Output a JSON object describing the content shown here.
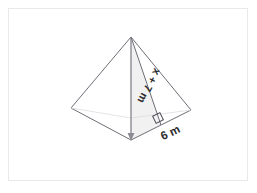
{
  "figure": {
    "name": "square-pyramid-with-slant-height",
    "background_color": "#ffffff",
    "frame_border_color": "#e9e9e9",
    "stroke_color": "#6e6e78",
    "face_fill_color": "#f2f2f2",
    "label_color": "#2b2b2b"
  },
  "labels": {
    "slant_height": "x + 7 m",
    "base_half_width": "6 m"
  },
  "geometry": {
    "apex": {
      "x": 131,
      "y": 37
    },
    "left_vertex": {
      "x": 71,
      "y": 108
    },
    "right_vertex": {
      "x": 191,
      "y": 110
    },
    "front_vertex": {
      "x": 131,
      "y": 140
    },
    "base_midpoint_right": {
      "x": 161,
      "y": 125
    },
    "altitude": {
      "from": "apex",
      "to": "front_vertex"
    },
    "slant_height_line": {
      "from": "apex",
      "to": "base_midpoint_right"
    },
    "right_angle_marker": {
      "x": 158,
      "y": 118,
      "size": 8,
      "rotation_deg": -26
    }
  },
  "annotations": {
    "slant_label_rotation_deg": 118,
    "base_label_rotation_deg": -26
  }
}
